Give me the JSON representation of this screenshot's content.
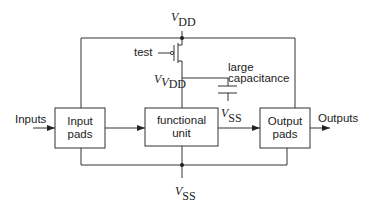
{
  "diagram": {
    "type": "block diagram with power gating",
    "supply_top": {
      "symbol": "V",
      "subscript": "DD"
    },
    "supply_bottom": {
      "symbol": "V",
      "subscript": "SS"
    },
    "virtual_supply": {
      "symbol": "V",
      "subscript_prefix": "V",
      "subscript": "DD"
    },
    "capacitor_ground": {
      "symbol": "V",
      "subscript": "SS"
    },
    "test_label": "test",
    "capacitor_label_line1": "large",
    "capacitor_label_line2": "capacitance",
    "inputs_label": "Inputs",
    "outputs_label": "Outputs",
    "blocks": [
      {
        "id": "input-pads",
        "line1": "Input",
        "line2": "pads"
      },
      {
        "id": "functional-unit",
        "line1": "functional",
        "line2": "unit"
      },
      {
        "id": "output-pads",
        "line1": "Output",
        "line2": "pads"
      }
    ],
    "colors": {
      "line": "#333333",
      "background": "#ffffff",
      "text": "#222222"
    }
  }
}
